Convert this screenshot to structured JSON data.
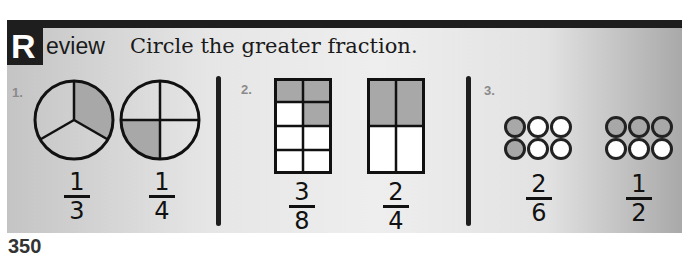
{
  "header": {
    "badge_letter": "R",
    "title_rest": "eview",
    "instruction": "Circle the greater fraction."
  },
  "colors": {
    "bar": "#1e1e1e",
    "shaded": "#a8a8a8",
    "unshaded": "#ffffff",
    "label_gray": "#8a8a8a"
  },
  "problems": [
    {
      "number": "1.",
      "model": "circle",
      "options": [
        {
          "numerator": "1",
          "denominator": "3",
          "parts": 3,
          "shaded": 1
        },
        {
          "numerator": "1",
          "denominator": "4",
          "parts": 4,
          "shaded": 1
        }
      ]
    },
    {
      "number": "2.",
      "model": "rectangle-grid",
      "options": [
        {
          "numerator": "3",
          "denominator": "8",
          "parts": 8,
          "shaded": 3
        },
        {
          "numerator": "2",
          "denominator": "4",
          "parts": 4,
          "shaded": 2
        }
      ]
    },
    {
      "number": "3.",
      "model": "counters",
      "options": [
        {
          "numerator": "2",
          "denominator": "6",
          "parts": 6,
          "shaded": 2
        },
        {
          "numerator": "1",
          "denominator": "2",
          "parts": 6,
          "shaded": 3
        }
      ]
    }
  ],
  "footer": {
    "page_number": "350"
  }
}
